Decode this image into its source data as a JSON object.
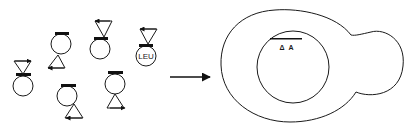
{
  "diagram": {
    "type": "cell-to-nucleus illustration",
    "left_cells": [
      {
        "id": 1,
        "label": "",
        "triangle": "above",
        "arrow": "right"
      },
      {
        "id": 2,
        "label": "",
        "triangle": "below",
        "arrow": "left"
      },
      {
        "id": 3,
        "label": "",
        "triangle": "above",
        "arrow": "left"
      },
      {
        "id": 4,
        "label": "LEU",
        "triangle": "above",
        "arrow": "left"
      },
      {
        "id": 5,
        "label": "",
        "triangle": "below",
        "arrow": "left"
      },
      {
        "id": 6,
        "label": "",
        "triangle": "below",
        "arrow": "right"
      }
    ],
    "transition_arrow": "right-arrow",
    "right_cell": {
      "shape": "budding cell",
      "inner": "nucleus",
      "marker_label": "Δ A"
    }
  },
  "labels": {
    "leu": "LEU",
    "delta_a": "Δ A"
  },
  "colors": {
    "stroke": "#1a1a1a",
    "background": "#ffffff"
  }
}
